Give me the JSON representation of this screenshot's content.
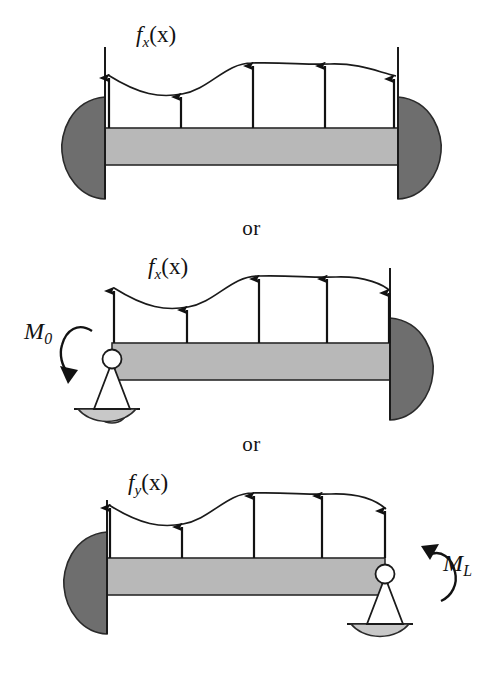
{
  "figure": {
    "separator_label": "or",
    "background_color": "#ffffff",
    "ink_color": "#121212",
    "beam_fill_color": "#b8b8b8",
    "fixed_support_fill_color": "#6e6e6e",
    "rocker_fill_color": "#c8c8c8"
  },
  "panels": [
    {
      "id": "panel-1",
      "name": "fixed-fixed-beam",
      "load_label": "f",
      "load_subscript": "x",
      "load_argument": "(x)",
      "left_support": "fixed",
      "right_support": "fixed",
      "moment_label": null,
      "arrow_count": 5
    },
    {
      "id": "panel-2",
      "name": "pinned-fixed-beam",
      "load_label": "f",
      "load_subscript": "x",
      "load_argument": "(x)",
      "left_support": "pinned",
      "right_support": "fixed",
      "moment_label": "M",
      "moment_subscript": "0",
      "moment_direction": "clockwise",
      "arrow_count": 5
    },
    {
      "id": "panel-3",
      "name": "fixed-pinned-beam",
      "load_label": "f",
      "load_subscript": "y",
      "load_argument": "(x)",
      "left_support": "fixed",
      "right_support": "pinned",
      "moment_label": "M",
      "moment_subscript": "L",
      "moment_direction": "counterclockwise",
      "arrow_count": 5
    }
  ],
  "labels": {
    "load_1": "f",
    "load_1_sub": "x",
    "load_1_arg": "(x)",
    "load_2": "f",
    "load_2_sub": "x",
    "load_2_arg": "(x)",
    "load_3": "f",
    "load_3_sub": "y",
    "load_3_arg": "(x)",
    "moment_0": "M",
    "moment_0_sub": "0",
    "moment_L": "M",
    "moment_L_sub": "L",
    "or_1": "or",
    "or_2": "or"
  }
}
